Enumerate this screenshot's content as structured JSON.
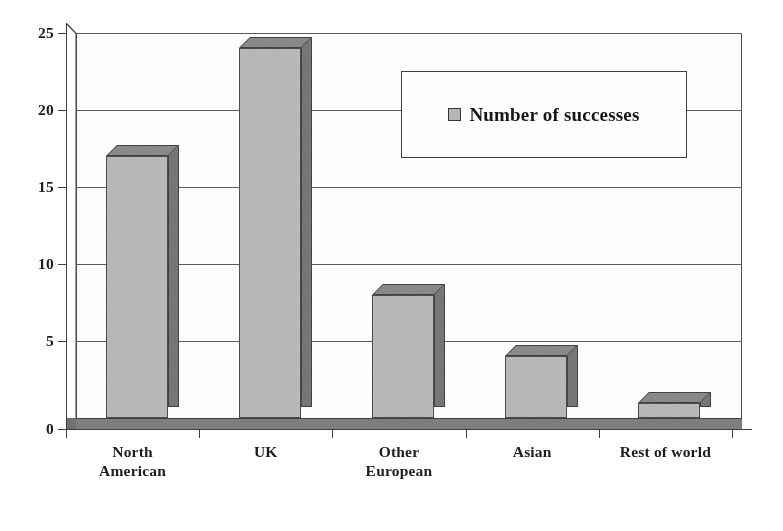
{
  "chart_data": {
    "type": "bar",
    "title": "",
    "subtitle": "",
    "xlabel": "",
    "ylabel": "",
    "categories": [
      "North American",
      "UK",
      "Other European",
      "Asian",
      "Rest of world"
    ],
    "category_lines": [
      [
        "North",
        "American"
      ],
      [
        "UK",
        ""
      ],
      [
        "Other",
        "European"
      ],
      [
        "Asian",
        ""
      ],
      [
        "Rest of world",
        ""
      ]
    ],
    "series": [
      {
        "name": "Number of successes",
        "values": [
          17,
          24,
          8,
          4,
          1
        ]
      }
    ],
    "values": [
      17,
      24,
      8,
      4,
      1
    ],
    "ylim": [
      0,
      25
    ],
    "ytick_values": [
      0,
      5,
      10,
      15,
      20,
      25
    ],
    "ytick_labels": [
      "0",
      "5",
      "10",
      "15",
      "20",
      "25"
    ],
    "grid": true,
    "grid_axis": "y",
    "legend_position": "upper right",
    "style": "3d-bar",
    "annotations": []
  },
  "legend": {
    "entries": [
      {
        "label": "Number of successes",
        "swatch_color": "#bdbdbd"
      }
    ]
  },
  "axes": {
    "y": {
      "labels": [
        "25",
        "20",
        "15",
        "10",
        "5",
        "0"
      ],
      "values": [
        25,
        20,
        15,
        10,
        5,
        0
      ],
      "min": 0,
      "max": 25
    },
    "x": {
      "labels": [
        "North American",
        "UK",
        "Other European",
        "Asian",
        "Rest of world"
      ]
    }
  },
  "colors": {
    "bar_front": "#bdbdbd",
    "bar_side": "#7a7a7a",
    "bar_top": "#8d8d8d",
    "axis": "#3b3b3b",
    "gridline": "#5a5a5a",
    "background": "#ffffff",
    "text": "#1a1a1a"
  }
}
